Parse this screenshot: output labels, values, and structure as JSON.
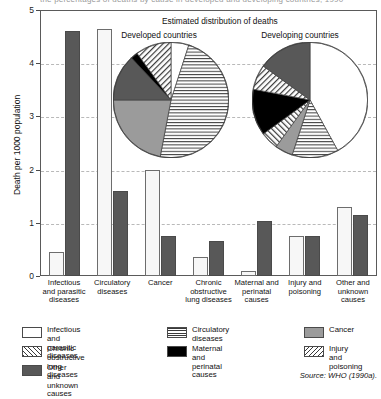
{
  "top_caption": "the percentages of deaths by cause in developed and developing countries, 1990",
  "axis": {
    "ylabel": "Death per 1000 population",
    "yticks": [
      "0",
      "1",
      "2",
      "3",
      "4",
      "5"
    ],
    "ymin": 0,
    "ymax": 5
  },
  "inset": {
    "title": "Estimated distribution of deaths",
    "pie_left_title": "Developed countries",
    "pie_right_title": "Developing countries"
  },
  "source": "Source: WHO (1990a).",
  "legend": [
    {
      "label": "Infectious and\nparasitic diseases",
      "pattern": "white",
      "color": "#ffffff"
    },
    {
      "label": "Circulatory diseases",
      "pattern": "horizontal-lines",
      "color": "#3a3a3a"
    },
    {
      "label": "Cancer",
      "pattern": "solid-gray",
      "color": "#9b9b9b"
    },
    {
      "label": "Chronic obstructive\nlung diseases",
      "pattern": "backslash-hatch",
      "color": "#3a3a3a"
    },
    {
      "label": "Maternal and perinatal causes",
      "pattern": "solid-black",
      "color": "#000000"
    },
    {
      "label": "Injury and poisoning",
      "pattern": "forwardslash-hatch",
      "color": "#3a3a3a"
    },
    {
      "label": "Other and unknown causes",
      "pattern": "solid-dark-gray",
      "color": "#585858"
    }
  ],
  "chart_data": {
    "type": "bar",
    "title": "",
    "xlabel": "",
    "ylabel": "Death per 1000 population",
    "ylim": [
      0,
      5
    ],
    "grid": true,
    "categories": [
      "Infectious\nand parasitic\ndiseases",
      "Circulatory\ndiseases",
      "Cancer",
      "Chronic\nobstructive\nlung diseases",
      "Maternal and\nperinatal\ncauses",
      "Injury and\npoisoning",
      "Other and\nunknown\ncauses"
    ],
    "series": [
      {
        "name": "Developed countries",
        "style": "light",
        "values": [
          0.45,
          4.65,
          2.0,
          0.35,
          0.1,
          0.75,
          1.3
        ]
      },
      {
        "name": "Developing countries",
        "style": "dark",
        "values": [
          4.6,
          1.6,
          0.75,
          0.65,
          1.03,
          0.75,
          1.15
        ]
      }
    ]
  },
  "pie_data": [
    {
      "type": "pie",
      "title": "Developed countries",
      "labels": [
        "Infectious and parasitic diseases",
        "Circulatory diseases",
        "Cancer",
        "Other and unknown causes",
        "Maternal and perinatal causes",
        "Chronic obstructive lung diseases"
      ],
      "values": [
        5,
        48,
        22,
        13,
        2,
        10
      ],
      "patterns": [
        "white",
        "horizontal-lines",
        "solid-gray",
        "solid-dark-gray",
        "solid-black",
        "backslash-hatch"
      ]
    },
    {
      "type": "pie",
      "title": "Developing countries",
      "labels": [
        "Infectious and parasitic diseases",
        "Circulatory diseases",
        "Cancer",
        "Injury and poisoning",
        "Maternal and perinatal causes",
        "Chronic obstructive lung diseases",
        "Other and unknown causes"
      ],
      "values": [
        42,
        13,
        5,
        5,
        13,
        7,
        15
      ],
      "patterns": [
        "white",
        "horizontal-lines",
        "solid-gray",
        "forwardslash-hatch",
        "solid-black",
        "backslash-hatch",
        "solid-dark-gray"
      ]
    }
  ]
}
